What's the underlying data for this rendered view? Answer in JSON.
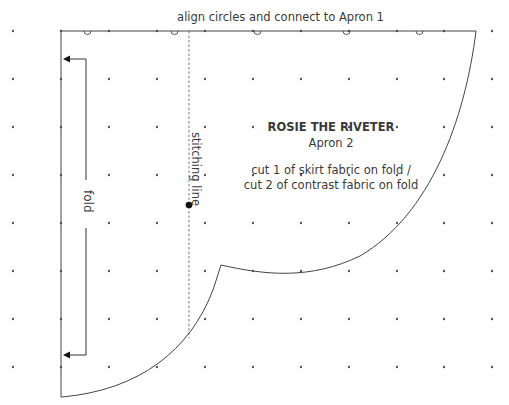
{
  "instruction": "align circles and connect to Apron 1",
  "pattern": {
    "title": "ROSIE THE RIVETER",
    "piece": "Apron 2",
    "cut_line_1": "cut 1 of skirt fabric on fold /",
    "cut_line_2": "cut 2 of contrast fabric on fold"
  },
  "labels": {
    "stitching_line": "stitching line",
    "fold": "fold"
  },
  "grid": {
    "columns_x": [
      13,
      61,
      109,
      157,
      205,
      253,
      301,
      349,
      397,
      444,
      492
    ],
    "rows_y": [
      31,
      79,
      127,
      175,
      223,
      271,
      319,
      367
    ]
  },
  "colors": {
    "line": "#444444",
    "dot": "#555555",
    "text": "#3a3a3a"
  }
}
